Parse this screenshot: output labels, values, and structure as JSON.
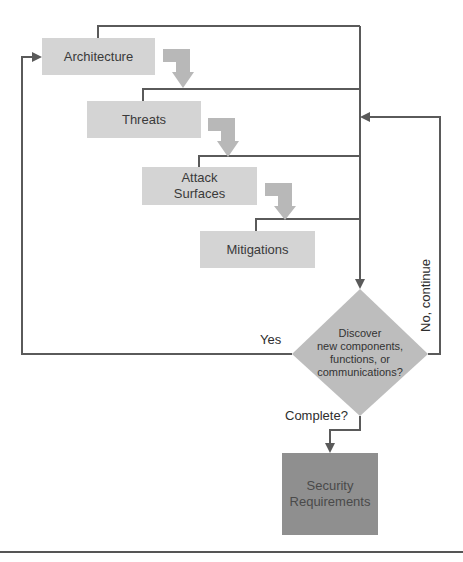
{
  "diagram": {
    "colors": {
      "process_box": "#d4d4d4",
      "decision_diamond": "#bdbdbd",
      "output_box": "#8f8f8f",
      "connector": "#5a5a5a",
      "step_arrow": "#b8b8b8"
    },
    "nodes": {
      "architecture": "Architecture",
      "threats": "Threats",
      "attack_surfaces_line1": "Attack",
      "attack_surfaces_line2": "Surfaces",
      "mitigations": "Mitigations",
      "decision_line1": "Discover",
      "decision_line2": "new components,",
      "decision_line3": "functions, or",
      "decision_line4": "communications?",
      "output_line1": "Security",
      "output_line2": "Requirements"
    },
    "edge_labels": {
      "yes": "Yes",
      "no_continue": "No, continue",
      "complete": "Complete?"
    }
  }
}
